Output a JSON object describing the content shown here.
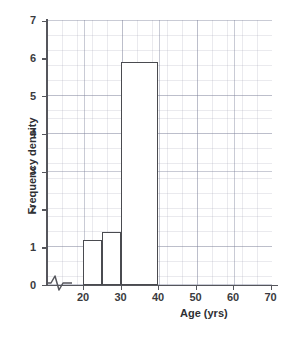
{
  "chart_data": {
    "type": "bar",
    "title": "",
    "subtitle": "",
    "xlabel": "Age (yrs)",
    "ylabel": "Frequency density",
    "xlim": [
      15,
      72
    ],
    "ylim": [
      0,
      7
    ],
    "grid": true,
    "legend": null,
    "axis_break_x": true,
    "x_ticks": [
      20,
      30,
      40,
      50,
      60,
      70
    ],
    "x_tick_labels": [
      "20",
      "30",
      "40",
      "50",
      "60",
      "70"
    ],
    "y_ticks": [
      0,
      1,
      2,
      3,
      4,
      5,
      6,
      7
    ],
    "y_tick_labels": [
      "0",
      "1",
      "2",
      "3",
      "4",
      "5",
      "6",
      "7"
    ],
    "bins": [
      {
        "label": "20-25",
        "x_start": 20,
        "x_end": 25,
        "value": 1.2
      },
      {
        "label": "25-30",
        "x_start": 25,
        "x_end": 30,
        "value": 1.4
      },
      {
        "label": "30-40",
        "x_start": 30,
        "x_end": 40,
        "value": 5.9
      }
    ],
    "categories": [
      "20-25",
      "25-30",
      "30-40"
    ],
    "values": [
      1.2,
      1.4,
      5.9
    ],
    "colors": {
      "bar_fill": "#ffffff",
      "bar_stroke": "#4a4b50",
      "axis": "#55565c",
      "grid": "#969aae",
      "text": "#2e2f33"
    }
  }
}
